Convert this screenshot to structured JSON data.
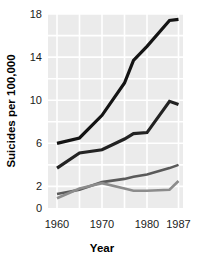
{
  "chart_data": {
    "type": "line",
    "title": "",
    "xlabel": "Year",
    "ylabel": "Suicides per 100,000",
    "xlim": [
      1958,
      1988
    ],
    "ylim": [
      0,
      18
    ],
    "xticks": [
      1960,
      1970,
      1980,
      1987
    ],
    "xtick_labels": [
      "1960",
      "1970",
      "1980",
      "1987"
    ],
    "yticks": [
      0,
      2,
      6,
      10,
      14,
      18
    ],
    "ytick_labels": [
      "0",
      "2",
      "6",
      "10",
      "14",
      "18"
    ],
    "grid": true,
    "grid_color": "#ffffff",
    "plot_background": "#ebebeb",
    "legend": null,
    "legend_position": "none",
    "x": [
      1960,
      1965,
      1970,
      1975,
      1977,
      1980,
      1985,
      1987
    ],
    "series": [
      {
        "name": "series-1",
        "color": "#141414",
        "linewidth": 3.2,
        "values": [
          6.0,
          6.5,
          8.6,
          11.6,
          13.7,
          15.0,
          17.4,
          17.5
        ]
      },
      {
        "name": "series-2",
        "color": "#232323",
        "linewidth": 3.2,
        "values": [
          3.7,
          5.1,
          5.4,
          6.4,
          6.9,
          7.0,
          9.9,
          9.6
        ]
      },
      {
        "name": "series-3",
        "color": "#5a5a5a",
        "linewidth": 2.6,
        "values": [
          1.3,
          1.7,
          2.4,
          2.7,
          2.9,
          3.1,
          3.7,
          4.0
        ]
      },
      {
        "name": "series-4",
        "color": "#8c8c8c",
        "linewidth": 2.6,
        "values": [
          0.9,
          1.8,
          2.3,
          1.8,
          1.6,
          1.6,
          1.7,
          2.5
        ]
      }
    ]
  }
}
